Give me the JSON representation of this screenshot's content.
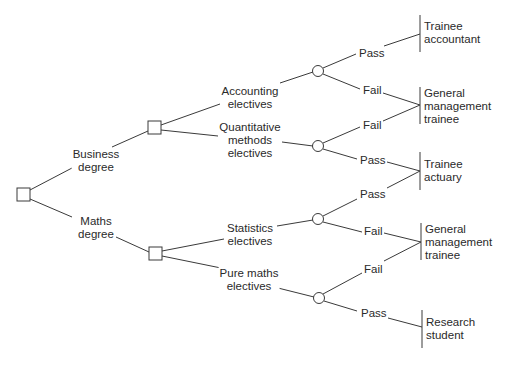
{
  "diagram": {
    "type": "decision-tree",
    "colors": {
      "line": "#3a3a3a",
      "text": "#2a2a2a",
      "background": "#ffffff"
    },
    "nodes": {
      "root": {
        "kind": "decision",
        "shape": "square"
      },
      "business": {
        "kind": "decision",
        "shape": "square"
      },
      "maths": {
        "kind": "decision",
        "shape": "square"
      },
      "chance_accounting": {
        "kind": "chance",
        "shape": "circle"
      },
      "chance_quantitative": {
        "kind": "chance",
        "shape": "circle"
      },
      "chance_statistics": {
        "kind": "chance",
        "shape": "circle"
      },
      "chance_pure_maths": {
        "kind": "chance",
        "shape": "circle"
      }
    },
    "branches": {
      "business_degree": "Business\ndegree",
      "maths_degree": "Maths\ndegree",
      "accounting_electives": "Accounting\nelectives",
      "quantitative_electives": "Quantitative\nmethods\nelectives",
      "statistics_electives": "Statistics\nelectives",
      "pure_maths_electives": "Pure maths\nelectives",
      "acc_pass": "Pass",
      "acc_fail": "Fail",
      "quant_fail": "Fail",
      "quant_pass": "Pass",
      "stat_pass": "Pass",
      "stat_fail": "Fail",
      "pure_fail": "Fail",
      "pure_pass": "Pass"
    },
    "outcomes": [
      {
        "label": "Trainee\naccountant"
      },
      {
        "label": "General\nmanagement\ntrainee"
      },
      {
        "label": "Trainee\nactuary"
      },
      {
        "label": "General\nmanagement\ntrainee"
      },
      {
        "label": "Research\nstudent"
      }
    ]
  }
}
